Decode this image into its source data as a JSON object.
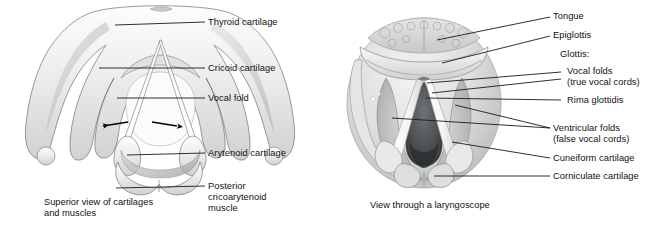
{
  "figure": {
    "background_color": "#ffffff",
    "line_color": "#1a1a1a",
    "text_color": "#111111"
  },
  "panel_a": {
    "name": "Superior view of laryngeal cartilages and muscles",
    "caption_line1": "Superior view of cartilages",
    "caption_line2": "and muscles",
    "labels": [
      {
        "id": "thyroid-cartilage",
        "text": "Thyroid cartilage"
      },
      {
        "id": "cricoid-cartilage",
        "text": "Cricoid cartilage"
      },
      {
        "id": "vocal-fold",
        "text": "Vocal fold"
      },
      {
        "id": "arytenoid-cartilage",
        "text": "Arytenoid cartilage"
      },
      {
        "id": "posterior-cricoarytenoid-muscle",
        "line1": "Posterior",
        "line2": "cricoarytenoid",
        "line3": "muscle"
      }
    ],
    "arrows": {
      "count": 2,
      "direction": "outward-lateral",
      "meaning": "abduction of vocal folds"
    }
  },
  "panel_b": {
    "name": "View through a laryngoscope",
    "caption": "View through a laryngoscope",
    "labels": [
      {
        "id": "tongue",
        "text": "Tongue"
      },
      {
        "id": "epiglottis",
        "text": "Epiglottis"
      },
      {
        "id": "glottis-heading",
        "text": "Glottis:"
      },
      {
        "id": "vocal-folds",
        "line1": "Vocal folds",
        "line2": "(true vocal cords)"
      },
      {
        "id": "rima-glottidis",
        "text": "Rima glottidis"
      },
      {
        "id": "ventricular-folds",
        "line1": "Ventricular folds",
        "line2": "(false vocal cords)"
      },
      {
        "id": "cuneiform-cartilage",
        "text": "Cuneiform cartilage"
      },
      {
        "id": "corniculate-cartilage",
        "text": "Corniculate cartilage"
      }
    ]
  }
}
